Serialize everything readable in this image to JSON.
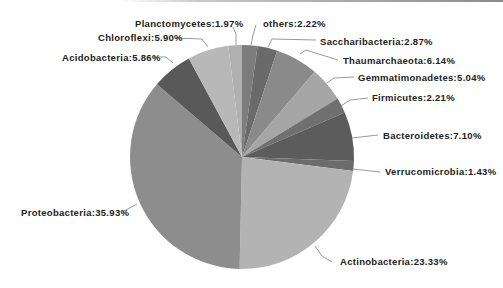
{
  "chart_data": {
    "type": "pie",
    "title": "",
    "start_angle_deg": 0,
    "direction": "clockwise",
    "center": [
      242,
      157
    ],
    "radius": 112,
    "slices": [
      {
        "label": "others",
        "value": 2.22,
        "display": "others:2.22%",
        "color": "#7c7c7c",
        "label_pos": [
          263,
          27
        ],
        "leader": [
          [
            251,
            45
          ],
          [
            253,
            35
          ],
          [
            256,
            25
          ]
        ]
      },
      {
        "label": "Saccharibacteria",
        "value": 2.87,
        "display": "Saccharibacteria:2.87%",
        "color": "#6a6a6a",
        "label_pos": [
          320,
          45
        ],
        "leader": [
          [
            268,
            47
          ],
          [
            272,
            39
          ],
          [
            316,
            40
          ]
        ]
      },
      {
        "label": "Thaumarchaeota",
        "value": 6.14,
        "display": "Thaumarchaeota:6.14%",
        "color": "#8a8a8a",
        "label_pos": [
          343,
          64
        ],
        "leader": [
          [
            300,
            54
          ],
          [
            306,
            50
          ],
          [
            338,
            60
          ]
        ]
      },
      {
        "label": "Gemmatimonadetes",
        "value": 5.04,
        "display": "Gemmatimonadetes:5.04%",
        "color": "#a6a6a6",
        "label_pos": [
          358,
          81
        ],
        "leader": [
          [
            327,
            83
          ],
          [
            334,
            78
          ],
          [
            354,
            77
          ]
        ]
      },
      {
        "label": "Firmicutes",
        "value": 2.21,
        "display": "Firmicutes:2.21%",
        "color": "#707070",
        "label_pos": [
          372,
          101
        ],
        "leader": [
          [
            341,
            106
          ],
          [
            350,
            100
          ],
          [
            368,
            98
          ]
        ]
      },
      {
        "label": "Bacteroidetes",
        "value": 7.1,
        "display": "Bacteroidetes:7.10%",
        "color": "#5c5c5c",
        "label_pos": [
          383,
          139
        ],
        "leader": [
          [
            352,
            138
          ],
          [
            378,
            135
          ]
        ]
      },
      {
        "label": "Verrucomicrobia",
        "value": 1.43,
        "display": "Verrucomicrobia:1.43%",
        "color": "#6c6c6c",
        "label_pos": [
          385,
          175
        ],
        "leader": [
          [
            353,
            169
          ],
          [
            380,
            172
          ]
        ]
      },
      {
        "label": "Actinobacteria",
        "value": 23.33,
        "display": "Actinobacteria:23.33%",
        "color": "#b3b3b3",
        "label_pos": [
          340,
          265
        ],
        "leader": [
          [
            315,
            246
          ],
          [
            322,
            256
          ],
          [
            332,
            262
          ]
        ]
      },
      {
        "label": "Proteobacteria",
        "value": 35.93,
        "display": "Proteobacteria:35.93%",
        "color": "#8d8d8d",
        "label_pos": [
          21,
          216
        ],
        "leader": [
          [
            137,
            204
          ],
          [
            122,
            212
          ]
        ]
      },
      {
        "label": "Acidobacteria",
        "value": 5.86,
        "display": "Acidobacteria:5.86%",
        "color": "#595959",
        "label_pos": [
          62,
          61
        ],
        "leader": [
          [
            173,
            63
          ],
          [
            166,
            57
          ],
          [
            152,
            57
          ]
        ]
      },
      {
        "label": "Chloroflexi",
        "value": 5.9,
        "display": "Chloroflexi:5.90%",
        "color": "#b8b8b8",
        "label_pos": [
          98,
          41
        ],
        "leader": [
          [
            208,
            47
          ],
          [
            202,
            39
          ],
          [
            176,
            38
          ]
        ]
      },
      {
        "label": "Planctomycetes",
        "value": 1.97,
        "display": "Planctomycetes:1.97%",
        "color": "#b0b0b0",
        "label_pos": [
          135,
          27
        ],
        "leader": [
          [
            236,
            45
          ],
          [
            236,
            34
          ],
          [
            233,
            27
          ]
        ]
      }
    ],
    "legend": "none (labels with leader lines)",
    "xlabel": "",
    "ylabel": ""
  }
}
